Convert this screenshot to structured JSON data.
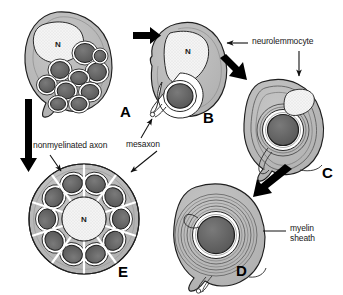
{
  "figure": {
    "background_color": "#ffffff"
  },
  "colors": {
    "cytoplasm": "#b8b8b8",
    "cytoplasm_light": "#c9c9c9",
    "axon_dark": "#5c5c5c",
    "axon_mid": "#6e6e6e",
    "nucleus_fill": "#f2f2f2",
    "outline": "#1f1f1f",
    "arrow": "#000000",
    "text": "#171717"
  },
  "panels": [
    {
      "id": "A",
      "letter": "A",
      "nucleus_label": "N",
      "description": "Neurolemmocyte enclosing a bundle of several nonmyelinated axons",
      "axon_count": 10
    },
    {
      "id": "B",
      "letter": "B",
      "nucleus_label": "N",
      "description": "Neurolemmocyte enclosing a single large axon with mesaxon",
      "axon_count": 1
    },
    {
      "id": "C",
      "letter": "C",
      "nucleus_label": "",
      "description": "Neurolemmocyte beginning to spiral around the axon, few myelin wraps",
      "axon_count": 1
    },
    {
      "id": "D",
      "letter": "D",
      "nucleus_label": "",
      "description": "Mature myelinated axon with many concentric wraps forming myelin sheath",
      "axon_count": 1
    },
    {
      "id": "E",
      "letter": "E",
      "nucleus_label": "N",
      "description": "Neurolemmocyte with ring of ten nonmyelinated axons in separate pockets",
      "axon_count": 10
    }
  ],
  "labels": [
    {
      "id": "neurolemmocyte",
      "text": "neurolemmocyte"
    },
    {
      "id": "mesaxon",
      "text": "mesaxon"
    },
    {
      "id": "nonmyelinated-axon",
      "text": "nonmyelinated axon"
    },
    {
      "id": "myelin-sheath-line1",
      "text": "myelin"
    },
    {
      "id": "myelin-sheath-line2",
      "text": "sheath"
    }
  ],
  "arrows": [
    {
      "id": "a-to-b",
      "from": "A",
      "to": "B",
      "style": "thick-block"
    },
    {
      "id": "b-to-c",
      "from": "B",
      "to": "C",
      "style": "thick-block-diagonal"
    },
    {
      "id": "c-to-d",
      "from": "C",
      "to": "D",
      "style": "thick-block-diagonal"
    },
    {
      "id": "a-to-e",
      "from": "A",
      "to": "E",
      "style": "thick-block-vertical"
    },
    {
      "id": "neurolemmocyte-to-b",
      "from": "neurolemmocyte",
      "to": "B",
      "style": "thin-line"
    },
    {
      "id": "neurolemmocyte-to-c",
      "from": "neurolemmocyte",
      "to": "C",
      "style": "thin-line"
    },
    {
      "id": "mesaxon-to-b",
      "from": "mesaxon",
      "to": "B",
      "style": "thin-line"
    },
    {
      "id": "mesaxon-to-e",
      "from": "mesaxon",
      "to": "E",
      "style": "thin-line"
    },
    {
      "id": "nonmyelinated-axon-to-e",
      "from": "nonmyelinated-axon",
      "to": "E",
      "style": "thin-line"
    },
    {
      "id": "myelin-sheath-to-d",
      "from": "myelin-sheath",
      "to": "D",
      "style": "leader-line"
    }
  ]
}
